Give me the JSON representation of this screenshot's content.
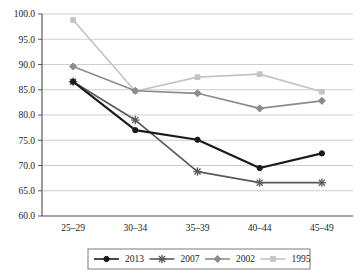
{
  "chart_data": {
    "type": "line",
    "title": "",
    "xlabel": "",
    "ylabel": "",
    "categories": [
      "25–29",
      "30–34",
      "35–39",
      "40–44",
      "45–49"
    ],
    "ylim": [
      60.0,
      100.0
    ],
    "ytick_labels": [
      "100.0",
      "95.0",
      "90.0",
      "85.0",
      "80.0",
      "75.0",
      "70.0",
      "65.0",
      "60.0"
    ],
    "ytick_values": [
      100.0,
      95.0,
      90.0,
      85.0,
      80.0,
      75.0,
      70.0,
      65.0,
      60.0
    ],
    "grid": true,
    "legend_position": "bottom",
    "series": [
      {
        "name": "2013",
        "values": [
          86.6,
          77.0,
          75.1,
          69.5,
          72.4
        ],
        "color": "#1a1a1a",
        "marker": "circle"
      },
      {
        "name": "2007",
        "values": [
          86.6,
          79.0,
          68.8,
          66.6,
          66.6
        ],
        "color": "#5a5a5a",
        "marker": "asterisk"
      },
      {
        "name": "2002",
        "values": [
          89.6,
          84.8,
          84.3,
          81.3,
          82.8
        ],
        "color": "#8c8c8c",
        "marker": "diamond"
      },
      {
        "name": "1995",
        "values": [
          98.8,
          84.7,
          87.5,
          88.1,
          84.6
        ],
        "color": "#c4c4c4",
        "marker": "square"
      }
    ]
  },
  "legend": {
    "items": [
      {
        "label": "2013"
      },
      {
        "label": "2007"
      },
      {
        "label": "2002"
      },
      {
        "label": "1995"
      }
    ]
  }
}
